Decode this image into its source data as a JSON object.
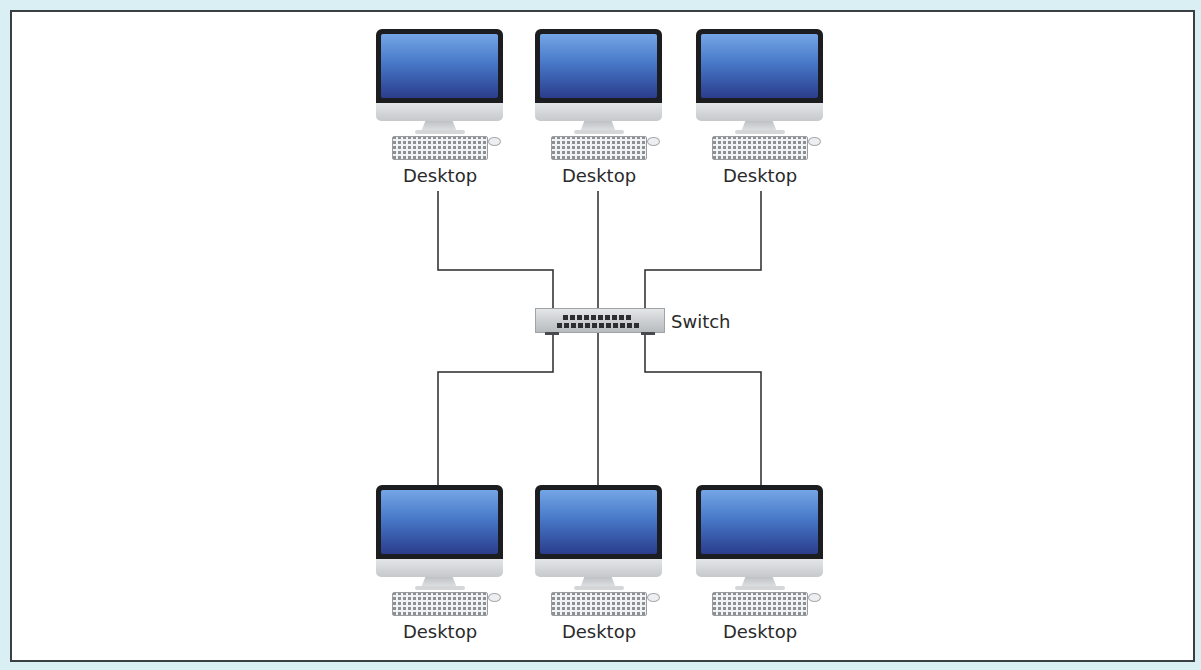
{
  "diagram": {
    "title": "",
    "type": "star network topology",
    "colors": {
      "background": "#d9eff3",
      "frame_border": "#3a3f44",
      "wire": "#2a2a2a",
      "screen_top": "#74a6e6",
      "screen_bottom": "#2a3d8c"
    },
    "switch": {
      "label": "Switch",
      "icon": "network-switch-icon"
    },
    "top_nodes": [
      {
        "label": "Desktop",
        "icon": "desktop-computer-icon"
      },
      {
        "label": "Desktop",
        "icon": "desktop-computer-icon"
      },
      {
        "label": "Desktop",
        "icon": "desktop-computer-icon"
      }
    ],
    "bottom_nodes": [
      {
        "label": "Desktop",
        "icon": "desktop-computer-icon"
      },
      {
        "label": "Desktop",
        "icon": "desktop-computer-icon"
      },
      {
        "label": "Desktop",
        "icon": "desktop-computer-icon"
      }
    ],
    "connections": [
      {
        "from": "top_nodes.0",
        "to": "switch"
      },
      {
        "from": "top_nodes.1",
        "to": "switch"
      },
      {
        "from": "top_nodes.2",
        "to": "switch"
      },
      {
        "from": "switch",
        "to": "bottom_nodes.0"
      },
      {
        "from": "switch",
        "to": "bottom_nodes.1"
      },
      {
        "from": "switch",
        "to": "bottom_nodes.2"
      }
    ]
  }
}
